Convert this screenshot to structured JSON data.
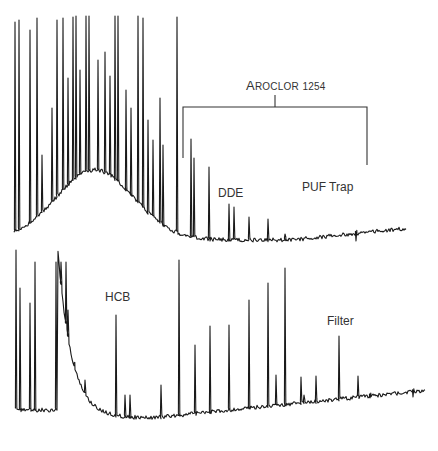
{
  "chart_data": {
    "type": "line",
    "title": "",
    "xlabel": "",
    "ylabel": "",
    "grid": false,
    "legend": "none",
    "annotations": {
      "bracket_label": "Aroclor 1254",
      "peak_labels": [
        "DDE",
        "HCB"
      ],
      "trace_labels": [
        "PUF Trap",
        "Filter"
      ]
    },
    "series": [
      {
        "name": "PUF Trap",
        "baseline_y_px": 240,
        "peaks": [
          {
            "x": 15,
            "top": 22
          },
          {
            "x": 19,
            "top": 20
          },
          {
            "x": 30,
            "top": 30
          },
          {
            "x": 37,
            "top": 18
          },
          {
            "x": 42,
            "top": 155
          },
          {
            "x": 52,
            "top": 108
          },
          {
            "x": 57,
            "top": 20
          },
          {
            "x": 63,
            "top": 18
          },
          {
            "x": 68,
            "top": 78
          },
          {
            "x": 73,
            "top": 17
          },
          {
            "x": 76,
            "top": 16
          },
          {
            "x": 80,
            "top": 70
          },
          {
            "x": 86,
            "top": 16
          },
          {
            "x": 89,
            "top": 16
          },
          {
            "x": 98,
            "top": 60
          },
          {
            "x": 105,
            "top": 52
          },
          {
            "x": 110,
            "top": 76
          },
          {
            "x": 115,
            "top": 16
          },
          {
            "x": 118,
            "top": 16
          },
          {
            "x": 126,
            "top": 90
          },
          {
            "x": 131,
            "top": 108
          },
          {
            "x": 138,
            "top": 16
          },
          {
            "x": 143,
            "top": 18
          },
          {
            "x": 148,
            "top": 120
          },
          {
            "x": 153,
            "top": 140
          },
          {
            "x": 160,
            "top": 98
          },
          {
            "x": 163,
            "top": 145
          },
          {
            "x": 177,
            "top": 17
          },
          {
            "x": 191,
            "top": 139
          },
          {
            "x": 194,
            "top": 158
          },
          {
            "x": 209,
            "top": 167
          },
          {
            "x": 229,
            "top": 204
          },
          {
            "x": 234,
            "top": 207
          },
          {
            "x": 249,
            "top": 217
          },
          {
            "x": 268,
            "top": 219
          },
          {
            "x": 285,
            "top": 234
          },
          {
            "x": 356,
            "top": 241
          },
          {
            "x": 406,
            "top": 240
          }
        ]
      },
      {
        "name": "Filter",
        "baseline_y_px": 420,
        "peaks": [
          {
            "x": 16,
            "top": 250
          },
          {
            "x": 20,
            "top": 288
          },
          {
            "x": 30,
            "top": 303
          },
          {
            "x": 35,
            "top": 262
          },
          {
            "x": 56,
            "top": 262
          },
          {
            "x": 61,
            "top": 262
          },
          {
            "x": 66,
            "top": 262
          },
          {
            "x": 68,
            "top": 310
          },
          {
            "x": 74,
            "top": 363
          },
          {
            "x": 85,
            "top": 380
          },
          {
            "x": 116,
            "top": 315
          },
          {
            "x": 125,
            "top": 395
          },
          {
            "x": 130,
            "top": 395
          },
          {
            "x": 161,
            "top": 385
          },
          {
            "x": 179,
            "top": 260
          },
          {
            "x": 195,
            "top": 345
          },
          {
            "x": 210,
            "top": 326
          },
          {
            "x": 229,
            "top": 325
          },
          {
            "x": 249,
            "top": 300
          },
          {
            "x": 268,
            "top": 283
          },
          {
            "x": 285,
            "top": 268
          },
          {
            "x": 276,
            "top": 375
          },
          {
            "x": 301,
            "top": 377
          },
          {
            "x": 304,
            "top": 395
          },
          {
            "x": 316,
            "top": 376
          },
          {
            "x": 339,
            "top": 336
          },
          {
            "x": 358,
            "top": 376
          },
          {
            "x": 370,
            "top": 398
          },
          {
            "x": 413,
            "top": 397
          }
        ]
      }
    ],
    "xlim": [
      0,
      438
    ],
    "ylim_px": [
      0,
      451
    ]
  },
  "labels": {
    "aroclor_first": "A",
    "aroclor_rest": "ROCLOR",
    "aroclor_num": "1254",
    "dde": "DDE",
    "puf_trap": "PUF Trap",
    "hcb": "HCB",
    "filter": "Filter"
  },
  "colors": {
    "trace": "#1a1a1a",
    "text": "#333333",
    "background": "#ffffff"
  }
}
